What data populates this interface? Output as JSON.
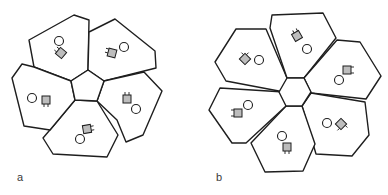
{
  "figure": {
    "panels": [
      {
        "label": "a",
        "center_shape": "pentagon",
        "chamber_count": 5,
        "stroke_color": "#1e1e1e",
        "square_fill": "#bdbdbd"
      },
      {
        "label": "b",
        "center_shape": "hexagon",
        "chamber_count": 6,
        "stroke_color": "#1e1e1e",
        "square_fill": "#bdbdbd"
      }
    ]
  }
}
